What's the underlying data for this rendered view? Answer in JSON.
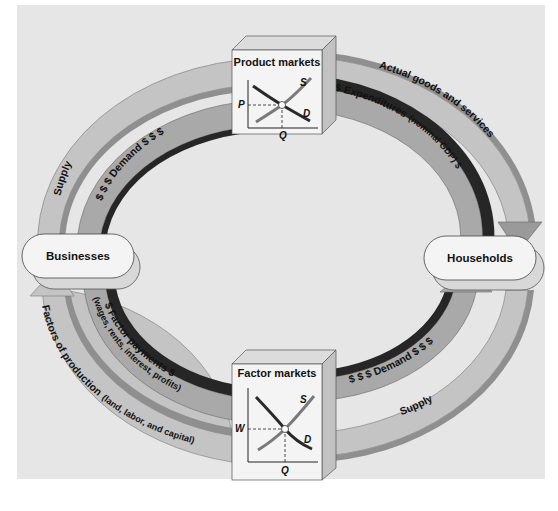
{
  "caption": "",
  "nodes": {
    "businesses": "Businesses",
    "households": "Households"
  },
  "markets": {
    "product": {
      "title": "Product markets",
      "supply": "S",
      "demand": "D",
      "price_axis": "P",
      "quantity_axis": "Q"
    },
    "factor": {
      "title": "Factor markets",
      "supply": "S",
      "demand": "D",
      "price_axis": "W",
      "quantity_axis": "Q"
    }
  },
  "flows": {
    "top_outer_left": "Supply",
    "top_outer_right": "Actual goods and services",
    "top_inner_left": "$ $ $ Demand $ $ $",
    "top_inner_right_main": "$ Expenditures",
    "top_inner_right_sub": "(nominal GDP) $",
    "bottom_outer_left": "Factors of production",
    "bottom_outer_left_sub": "(land, labor, and capital)",
    "bottom_outer_right": "Supply",
    "bottom_inner_left_main": "$ Factor payments $",
    "bottom_inner_left_sub": "(wages, rents, interest, profits)",
    "bottom_inner_right": "$ $ $ Demand $ $ $"
  },
  "colors": {
    "panel_bg": "#e6e6e6",
    "light_band": "#c4c4c4",
    "mid_band": "#8f8f8f",
    "dark_band": "#262626",
    "box_face": "#f4f4f4",
    "supply_curve": "#7a7a7a",
    "demand_curve": "#2a2a2a"
  }
}
